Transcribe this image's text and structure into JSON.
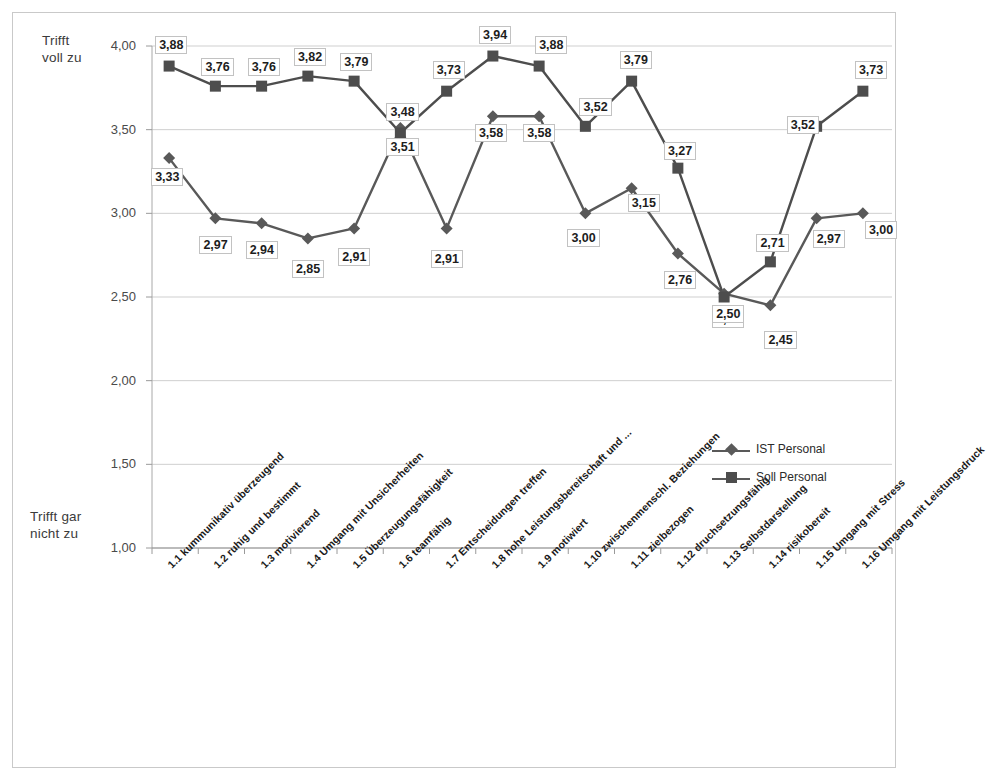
{
  "chart_data": {
    "type": "line",
    "title": "",
    "xlabel": "",
    "ylabel": "",
    "ylim": [
      1.0,
      4.0
    ],
    "ytick_labels": [
      "4,00",
      "3,50",
      "3,00",
      "2,50",
      "2,00",
      "1,50",
      "1,00"
    ],
    "ytick_values": [
      4.0,
      3.5,
      3.0,
      2.5,
      2.0,
      1.5,
      1.0
    ],
    "grid": true,
    "legend_position": "inside-right",
    "axis_caption_top": "Trifft\nvoll zu",
    "axis_caption_bottom": "Trifft gar\nnicht zu",
    "categories": [
      "1.1 kummunikativ überzeugend",
      "1.2 ruhig und bestimmt",
      "1.3 motivierend",
      "1.4 Umgang mit Unsicherheiten",
      "1.5 Überzeugungsfähigkeit",
      "1.6 teamfähig",
      "1.7 Entscheidungen treffen",
      "1.8 hohe Leistungsbereitschaft und ...",
      "1.9 motiwiert",
      "1.10 zwischenmenschl. Beziehungen",
      "1.11 zielbezogen",
      "1.12 druchsetzungsfähig",
      "1.13 Selbstdarstellung",
      "1.14 risikobereit",
      "1.15 Umgang mit Stress",
      "1.16 Umgang mit Leistungsdruck"
    ],
    "series": [
      {
        "name": "IST Personal",
        "marker": "diamond",
        "color": "#595959",
        "values": [
          3.33,
          2.97,
          2.94,
          2.85,
          2.91,
          3.51,
          2.91,
          3.58,
          3.58,
          3.0,
          3.15,
          2.76,
          2.52,
          2.45,
          2.97,
          3.0
        ],
        "labels": [
          "3,33",
          "2,97",
          "2,94",
          "2,85",
          "2,91",
          "3,51",
          "2,91",
          "3,58",
          "3,58",
          "3,00",
          "3,15",
          "2,76",
          "2,52",
          "2,45",
          "2,97",
          "3,00"
        ]
      },
      {
        "name": "Soll Personal",
        "marker": "square",
        "color": "#4d4d4d",
        "values": [
          3.88,
          3.76,
          3.76,
          3.82,
          3.79,
          3.48,
          3.73,
          3.94,
          3.88,
          3.52,
          3.79,
          3.27,
          2.5,
          2.71,
          3.52,
          3.73
        ],
        "labels": [
          "3,88",
          "3,76",
          "3,76",
          "3,82",
          "3,79",
          "3,48",
          "3,73",
          "3,94",
          "3,88",
          "3,52",
          "3,79",
          "3,27",
          "2,50",
          "2,71",
          "3,52",
          "3,73"
        ]
      }
    ]
  },
  "legend": {
    "items": [
      {
        "label": "IST Personal",
        "marker": "diamond"
      },
      {
        "label": "Soll Personal",
        "marker": "square"
      }
    ]
  }
}
